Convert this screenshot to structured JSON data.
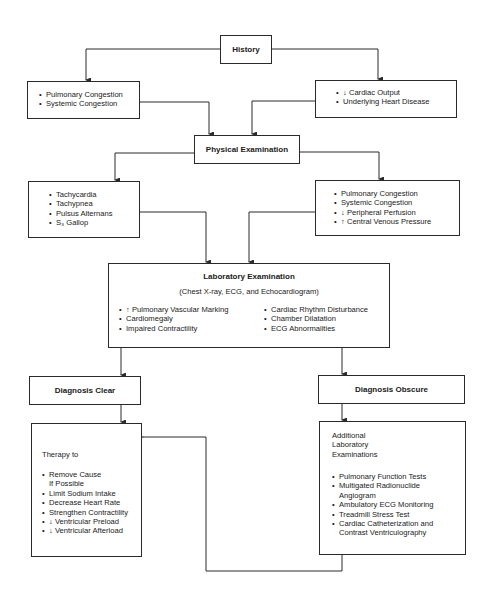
{
  "diagram": {
    "type": "flowchart",
    "history": {
      "title": "History"
    },
    "history_left": {
      "items": [
        "Pulmonary Congestion",
        "Systemic Congestion"
      ]
    },
    "history_right": {
      "items": [
        "↓ Cardiac Output",
        "Underlying Heart Disease"
      ]
    },
    "physical": {
      "title": "Physical Examination"
    },
    "physical_left": {
      "items": [
        "Tachycardia",
        "Tachypnea",
        "Pulsus Alternans",
        "S₃ Gallop"
      ]
    },
    "physical_right": {
      "items": [
        "Pulmonary Congestion",
        "Systemic Congestion",
        "↓  Peripheral Perfusion",
        "↑  Central Venous Pressure"
      ]
    },
    "lab": {
      "title": "Laboratory Examination",
      "subtitle": "(Chest X-ray, ECG, and Echocardiogram)",
      "left_items": [
        "↑  Pulmonary Vascular Marking",
        "Cardiomegaly",
        "Impaired Contractility"
      ],
      "right_items": [
        "Cardiac Rhythm Disturbance",
        "Chamber Dilatation",
        "ECG Abnormalities"
      ]
    },
    "dx_clear": {
      "title": "Diagnosis Clear"
    },
    "dx_obscure": {
      "title": "Diagnosis Obscure"
    },
    "therapy": {
      "heading": "Therapy to",
      "items": [
        "Remove Cause",
        "If Possible",
        "Limit Sodium Intake",
        "Decrease Heart Rate",
        "Strengthen Contractility",
        "↓ Ventricular Preload",
        "↓ Ventricular Afterload"
      ]
    },
    "additional": {
      "heading_lines": [
        "Additional",
        "Laboratory",
        "Examinations"
      ],
      "items": [
        "Pulmonary Function Tests",
        "Multigated Radionuclide",
        "Angiogram",
        "Ambulatory ECG Monitoring",
        "Treadmill Stress Test",
        "Cardiac Catheterization and",
        "Contrast Ventriculography"
      ]
    },
    "bullet": "•",
    "line_color": "#2a2a2a"
  }
}
